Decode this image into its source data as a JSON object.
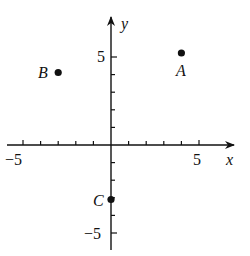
{
  "diagram": {
    "type": "coordinate-plane",
    "axes": {
      "x_label": "x",
      "y_label": "y",
      "x_range": [
        -5,
        5
      ],
      "y_range": [
        -5,
        5
      ],
      "tick_labels": {
        "x_neg": "−5",
        "x_pos": "5",
        "y_pos": "5",
        "y_neg": "−5"
      }
    },
    "points": [
      {
        "label": "A",
        "x": 4,
        "y": 5
      },
      {
        "label": "B",
        "x": -3,
        "y": 4
      },
      {
        "label": "C",
        "x": 0,
        "y": -3
      }
    ]
  }
}
